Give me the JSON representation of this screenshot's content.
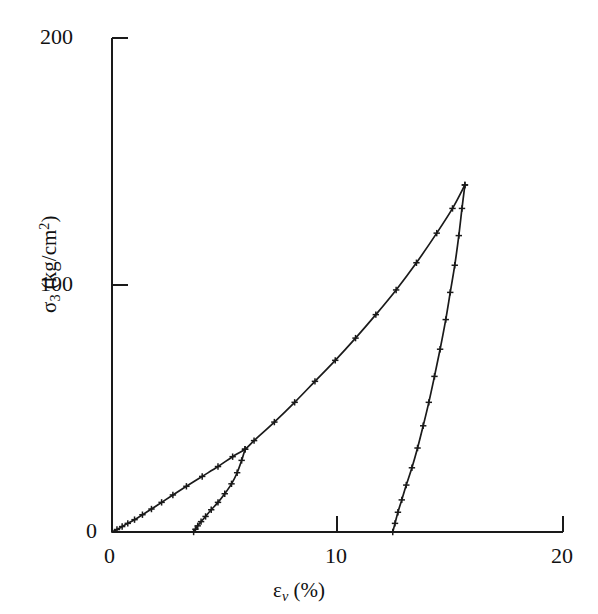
{
  "figure": {
    "background_color": "#ffffff",
    "line_color": "#1a1a1a",
    "marker_color": "#1a1a1a"
  },
  "axes": {
    "y": {
      "title_main": "σ",
      "title_sub": "3",
      "title_unit_open": " (kg/cm",
      "title_unit_sup": "2",
      "title_unit_close": ")",
      "ticks": [
        "0",
        "100",
        "200"
      ],
      "tick_values": [
        0,
        100,
        200
      ],
      "min": 0,
      "max": 200
    },
    "x": {
      "title_main": "ε",
      "title_sub": "v",
      "title_unit": " (%)",
      "ticks": [
        "0",
        "10",
        "20"
      ],
      "tick_values": [
        0,
        10,
        20
      ],
      "min": 0,
      "max": 20
    }
  },
  "chart_data": {
    "type": "line",
    "title": "",
    "xlabel": "εv (%)",
    "ylabel": "σ3 (kg/cm2)",
    "xlim": [
      0,
      20
    ],
    "ylim": [
      0,
      200
    ],
    "xticks": [
      0,
      10,
      20
    ],
    "yticks": [
      0,
      100,
      200
    ],
    "grid": false,
    "legend": "none",
    "marker_style": "plus",
    "series": [
      {
        "name": "Loading curve",
        "marker": "plus",
        "x": [
          0.0,
          0.22,
          0.45,
          0.7,
          1.0,
          1.35,
          1.75,
          2.2,
          2.7,
          3.3,
          4.0,
          4.7,
          5.35,
          5.9,
          6.3,
          7.2,
          8.1,
          9.0,
          9.9,
          10.8,
          11.7,
          12.6,
          13.5,
          14.4,
          15.1,
          15.65
        ],
        "y": [
          0.0,
          1.0,
          2.2,
          3.5,
          5.0,
          7.0,
          9.3,
          12.0,
          15.0,
          18.5,
          22.5,
          26.5,
          30.5,
          33.5,
          37.0,
          44.5,
          52.5,
          61.0,
          69.5,
          78.5,
          88.0,
          98.0,
          109.0,
          121.0,
          131.0,
          140.5
        ]
      },
      {
        "name": "Unload cycle 1",
        "marker": "plus",
        "x": [
          5.9,
          5.75,
          5.55,
          5.3,
          5.0,
          4.7,
          4.4,
          4.15,
          3.95,
          3.8,
          3.7,
          3.62
        ],
        "y": [
          33.5,
          29.0,
          24.0,
          19.5,
          15.5,
          12.0,
          9.0,
          6.3,
          4.2,
          2.5,
          1.1,
          0.0
        ]
      },
      {
        "name": "Unload cycle 2",
        "marker": "plus",
        "x": [
          15.65,
          15.52,
          15.38,
          15.2,
          15.0,
          14.8,
          14.55,
          14.3,
          14.05,
          13.8,
          13.55,
          13.3,
          13.05,
          12.85,
          12.68,
          12.55,
          12.45
        ],
        "y": [
          140.5,
          131.0,
          120.0,
          108.0,
          97.0,
          86.0,
          74.0,
          63.0,
          52.5,
          43.0,
          34.0,
          26.0,
          19.0,
          13.0,
          8.0,
          3.5,
          0.0
        ]
      }
    ]
  }
}
